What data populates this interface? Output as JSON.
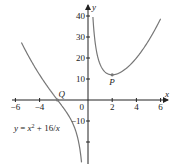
{
  "chart_data": {
    "type": "line",
    "title": "",
    "xlabel": "x",
    "ylabel": "y",
    "xlim": [
      -6,
      6
    ],
    "ylim": [
      -20,
      40
    ],
    "x_ticks": [
      -6,
      -4,
      2,
      4,
      6
    ],
    "x_tick_labels": [
      "−6",
      "−4",
      "2",
      "4",
      "6"
    ],
    "y_ticks": [
      40,
      30,
      20,
      10,
      -10
    ],
    "y_tick_labels": [
      "40",
      "30",
      "20",
      "10",
      "−10"
    ],
    "origin_label": "0",
    "grid": false,
    "series": [
      {
        "name": "y = x² + 16/x",
        "function": "x^2 + 16/x"
      }
    ],
    "annotations": [
      {
        "label": "Q",
        "x": -2.52,
        "y": 0
      },
      {
        "label": "P",
        "x": 2,
        "y": 12
      }
    ],
    "equation_label": "y = x² + 16/x"
  }
}
